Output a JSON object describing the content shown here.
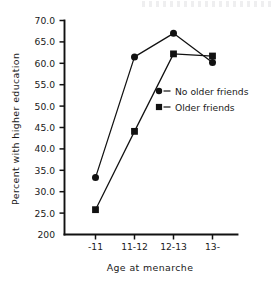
{
  "chart_data": {
    "type": "line",
    "title": "",
    "xlabel": "Age at menarche",
    "ylabel": "Percent with higher education",
    "categories": [
      "-11",
      "11-12",
      "12-13",
      "13-"
    ],
    "series": [
      {
        "name": "No older friends",
        "marker": "circle",
        "values": [
          33.3,
          61.5,
          67.0,
          60.2
        ]
      },
      {
        "name": "Older friends",
        "marker": "square",
        "values": [
          25.8,
          44.1,
          62.2,
          61.7
        ]
      }
    ],
    "ylim": [
      20.0,
      70.0
    ],
    "ytick_values": [
      70.0,
      65.0,
      60.0,
      55.0,
      50.0,
      45.0,
      40.0,
      35.0,
      30.0,
      25.0,
      20.0
    ],
    "ytick_labels": [
      "70.0",
      "65.0",
      "60.0",
      "55.0",
      "50.0",
      "45.0",
      "40.0",
      "35.0",
      "30.0",
      "25.0",
      "200"
    ],
    "grid": false,
    "legend_position": "center-right",
    "color": "#111111"
  },
  "axes": {
    "y_title": "Percent with higher education",
    "x_title": "Age at menarche"
  },
  "legend": {
    "entries": [
      {
        "label": "No older friends",
        "marker": "circle"
      },
      {
        "label": "Older friends",
        "marker": "square"
      }
    ]
  }
}
